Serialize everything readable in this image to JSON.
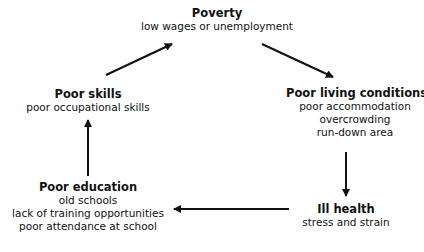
{
  "diagram": {
    "type": "cycle",
    "nodes": [
      {
        "id": "poverty",
        "title": "Poverty",
        "lines": [
          "low wages or unemployment"
        ]
      },
      {
        "id": "living",
        "title": "Poor living conditions",
        "lines": [
          "poor accommodation",
          "overcrowding",
          "run-down area"
        ]
      },
      {
        "id": "health",
        "title": "Ill health",
        "lines": [
          "stress and strain"
        ]
      },
      {
        "id": "education",
        "title": "Poor education",
        "lines": [
          "old schools",
          "lack of training opportunities",
          "poor attendance at school"
        ]
      },
      {
        "id": "skills",
        "title": "Poor skills",
        "lines": [
          "poor occupational skills"
        ]
      }
    ],
    "edges": [
      {
        "from": "poverty",
        "to": "living"
      },
      {
        "from": "living",
        "to": "health"
      },
      {
        "from": "health",
        "to": "education"
      },
      {
        "from": "education",
        "to": "skills"
      },
      {
        "from": "skills",
        "to": "poverty"
      }
    ],
    "arrow_color": "#111111"
  }
}
